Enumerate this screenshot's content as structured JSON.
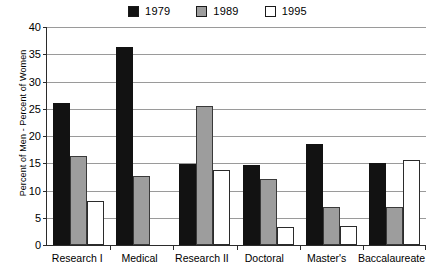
{
  "chart_data": {
    "type": "bar",
    "title": "",
    "subtitle": "",
    "xlabel": "",
    "ylabel": "Percent of Men - Percent of Women",
    "ylim": [
      0,
      40
    ],
    "ytick_values": [
      0,
      5,
      10,
      15,
      20,
      25,
      30,
      35,
      40
    ],
    "ytick_labels": [
      "0",
      "5",
      "10",
      "15",
      "20",
      "25",
      "30",
      "35",
      "40"
    ],
    "grid": true,
    "legend_position": "top-center",
    "categories": [
      "Research I",
      "Medical",
      "Research II",
      "Doctoral",
      "Master's",
      "Baccalaureate"
    ],
    "series": [
      {
        "name": "1979",
        "color": "#121212",
        "values": [
          26.1,
          36.4,
          14.8,
          14.7,
          18.5,
          15.0
        ]
      },
      {
        "name": "1989",
        "color": "#9d9d9d",
        "values": [
          16.3,
          12.7,
          25.5,
          12.2,
          7.0,
          7.0
        ]
      },
      {
        "name": "1995",
        "color": "#ffffff",
        "values": [
          8.0,
          0.0,
          13.8,
          3.3,
          3.4,
          15.6
        ]
      }
    ]
  },
  "legend": {
    "entries": [
      {
        "label": "1979",
        "color": "#121212"
      },
      {
        "label": "1989",
        "color": "#9d9d9d"
      },
      {
        "label": "1995",
        "color": "#ffffff"
      }
    ]
  },
  "axes": {
    "y_title": "Percent of Men - Percent of Women"
  }
}
